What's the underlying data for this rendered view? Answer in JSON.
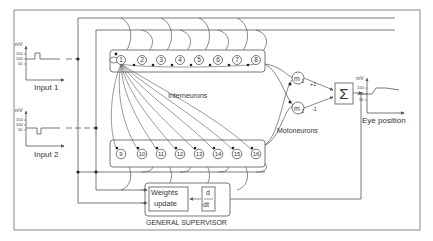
{
  "colors": {
    "line": "#555555",
    "text": "#333333",
    "background": "#ffffff",
    "frame": "#888888"
  },
  "inputs": [
    {
      "label": "Input 1",
      "axis_unit": "mV",
      "ticks": [
        "150",
        "100",
        "50"
      ],
      "signal": "pulse-up"
    },
    {
      "label": "Input 2",
      "axis_unit": "mV",
      "ticks": [
        "150",
        "100",
        "50"
      ],
      "signal": "pulse-down"
    }
  ],
  "interneurons": {
    "label": "Interneurons",
    "row1": [
      "1",
      "2",
      "3",
      "4",
      "5",
      "6",
      "7",
      "8"
    ],
    "row2": [
      "9",
      "10",
      "11",
      "12",
      "13",
      "14",
      "15",
      "16"
    ]
  },
  "motoneurons": {
    "label": "Motoneurons",
    "units": [
      {
        "name": "m",
        "sub": "1",
        "weight": "+1"
      },
      {
        "name": "m",
        "sub": "2",
        "weight": "-1"
      }
    ]
  },
  "summation": {
    "symbol": "Σ"
  },
  "output": {
    "label": "Eye position",
    "axis_unit": "mV",
    "ticks": [
      "150",
      "100",
      "50"
    ]
  },
  "supervisor": {
    "label": "GENERAL SUPERVISOR",
    "weights_update": [
      "Weights",
      "update"
    ],
    "derivative": {
      "numerator": "d",
      "denominator": "dt"
    }
  }
}
